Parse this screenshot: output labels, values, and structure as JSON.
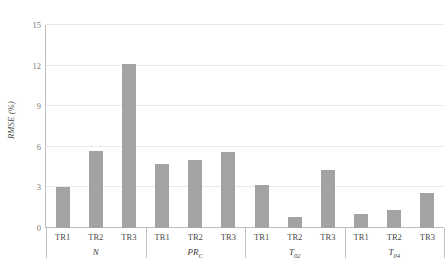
{
  "chart_data": {
    "type": "bar",
    "title": "",
    "xlabel": "",
    "ylabel": "RMSE (%)",
    "ylim": [
      0,
      15
    ],
    "yticks": [
      0,
      3,
      6,
      9,
      12,
      15
    ],
    "ytick_labels": [
      "0",
      "3",
      "6",
      "9",
      "12",
      "15"
    ],
    "grid": true,
    "legend": "none",
    "categories": [
      "TR1",
      "TR2",
      "TR3"
    ],
    "groups": [
      {
        "label": "N",
        "label_base": "N",
        "label_sub": "",
        "bars": [
          {
            "category": "TR1",
            "value": 3.0
          },
          {
            "category": "TR2",
            "value": 5.7
          },
          {
            "category": "TR3",
            "value": 12.1
          }
        ]
      },
      {
        "label": "PRC",
        "label_base": "PR",
        "label_sub": "C",
        "bars": [
          {
            "category": "TR1",
            "value": 4.7
          },
          {
            "category": "TR2",
            "value": 5.0
          },
          {
            "category": "TR3",
            "value": 5.65
          }
        ]
      },
      {
        "label": "T02",
        "label_base": "T",
        "label_sub": "02",
        "bars": [
          {
            "category": "TR1",
            "value": 3.2
          },
          {
            "category": "TR2",
            "value": 0.8
          },
          {
            "category": "TR3",
            "value": 4.3
          }
        ]
      },
      {
        "label": "T04",
        "label_base": "T",
        "label_sub": "04",
        "bars": [
          {
            "category": "TR1",
            "value": 1.0
          },
          {
            "category": "TR2",
            "value": 1.3
          },
          {
            "category": "TR3",
            "value": 2.6
          }
        ]
      }
    ],
    "colors": {
      "bar": "#a3a3a3",
      "grid": "#e9e9e9",
      "axis": "#bdbdbd",
      "text": "#4a4a4a",
      "tick_text": "#7a7a7a",
      "background": "#ffffff"
    }
  }
}
